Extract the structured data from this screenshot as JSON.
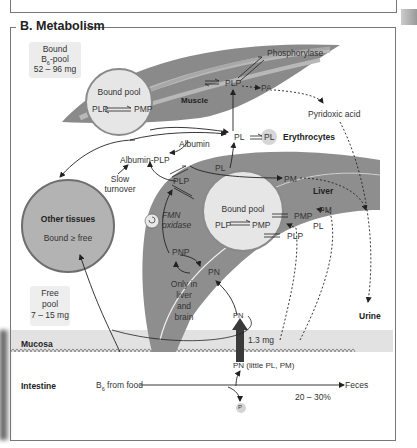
{
  "panel": {
    "title": "B. Metabolism"
  },
  "pools": {
    "bound_b6": {
      "line1": "Bound",
      "line2_main": "B",
      "line2_sub": "6",
      "line2_rest": "-pool",
      "line3": "52 – 96 mg"
    },
    "free": {
      "line1": "Free",
      "line2": "pool",
      "line3": "7 – 15 mg"
    }
  },
  "muscle": {
    "label": "Muscle",
    "bound_pool_title": "Bound pool",
    "bound_pool_left": "PLP",
    "bound_pool_right": "PMP",
    "plp": "PLP",
    "pa": "PA",
    "phosphorylase": "Phosphorylase"
  },
  "pyridoxic_acid": "Pyridoxic acid",
  "erythrocytes": {
    "pl_plasma": "PL",
    "pl_cell": "PL",
    "label": "Erythrocytes"
  },
  "albumin": "Albumin",
  "albumin_plp": "Albumin-PLP",
  "slow_turnover": {
    "line1": "Slow",
    "line2": "turnover"
  },
  "other_tissues": {
    "title": "Other tissues",
    "subtitle": "Bound ≥ free"
  },
  "liver": {
    "label": "Liver",
    "plp_top": "PLP",
    "pl_top": "PL",
    "pm_top": "PM",
    "bound_pool_title": "Bound pool",
    "bound_pool_left": "PLP",
    "bound_pool_right": "PMP",
    "pmp": "PMP",
    "plp_low": "PLP",
    "pm_right": "PM",
    "pl_right": "PL",
    "fmn_oxidase_line1": "FMN",
    "fmn_oxidase_line2": "oxidase",
    "pnp": "PNP",
    "pn": "PN",
    "only_in": {
      "line1": "Only in",
      "line2": "liver",
      "line3": "and",
      "line4": "brain"
    }
  },
  "urine": "Urine",
  "mucosa": {
    "label": "Mucosa",
    "pn": "PN",
    "amount": "1.3 mg"
  },
  "intestine": {
    "label": "Intestine",
    "b6_main": "B",
    "b6_sub": "6",
    "b6_rest": " from food",
    "pn_little": "PN (little PL, PM)",
    "feces": "Feces",
    "feces_pct": "20 – 30%",
    "phosphate": "P"
  },
  "colors": {
    "liver_gray": "#8e8e8e",
    "muscle_dark": "#8a8a8a",
    "muscle_light": "#b5b5b5",
    "pool_circle": "#e6e6e6",
    "pool_border": "#8a8a8a",
    "other_tissues_fill": "#b3b3b3",
    "mucosa_band": "#e0e0e0"
  }
}
